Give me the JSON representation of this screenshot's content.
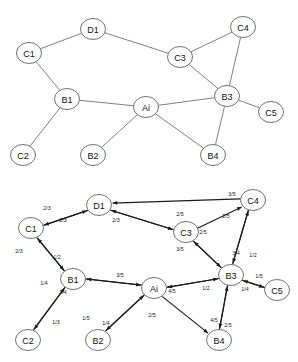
{
  "figure": {
    "title": "",
    "width": 298,
    "height": 362,
    "background_color": "#ffffff",
    "node_stroke_color": "#4d4d4d",
    "edge_color": "#555555",
    "arrow_color": "#1a1a1a",
    "label_color": "#111111"
  },
  "panels": [
    {
      "id": "upper-graph",
      "name": "undirected-topology-graph",
      "type": "graph",
      "directed": false,
      "weighted": false,
      "nodes": [
        {
          "id": "C1",
          "label": "C1",
          "x": 29,
          "y": 53
        },
        {
          "id": "D1",
          "label": "D1",
          "x": 93,
          "y": 29
        },
        {
          "id": "C3",
          "label": "C3",
          "x": 180,
          "y": 57
        },
        {
          "id": "C4",
          "label": "C4",
          "x": 243,
          "y": 27
        },
        {
          "id": "B3",
          "label": "B3",
          "x": 227,
          "y": 96
        },
        {
          "id": "C5",
          "label": "C5",
          "x": 271,
          "y": 112
        },
        {
          "id": "B1",
          "label": "B1",
          "x": 67,
          "y": 99
        },
        {
          "id": "Ai",
          "label": "Ai",
          "x": 146,
          "y": 107
        },
        {
          "id": "C2",
          "label": "C2",
          "x": 23,
          "y": 155
        },
        {
          "id": "B2",
          "label": "B2",
          "x": 93,
          "y": 155
        },
        {
          "id": "B4",
          "label": "B4",
          "x": 213,
          "y": 155
        }
      ],
      "edges": [
        {
          "from": "C1",
          "to": "D1"
        },
        {
          "from": "D1",
          "to": "C3"
        },
        {
          "from": "C3",
          "to": "C4"
        },
        {
          "from": "C3",
          "to": "B3"
        },
        {
          "from": "C4",
          "to": "B3"
        },
        {
          "from": "B3",
          "to": "C5"
        },
        {
          "from": "B3",
          "to": "Ai"
        },
        {
          "from": "B3",
          "to": "B4"
        },
        {
          "from": "C1",
          "to": "B1"
        },
        {
          "from": "B1",
          "to": "Ai"
        },
        {
          "from": "B1",
          "to": "C2"
        },
        {
          "from": "Ai",
          "to": "B2"
        },
        {
          "from": "Ai",
          "to": "B4"
        }
      ]
    },
    {
      "id": "lower-graph",
      "name": "directed-weighted-graph",
      "type": "graph",
      "directed": true,
      "weighted": true,
      "nodes": [
        {
          "id": "C1",
          "label": "C1",
          "x": 31,
          "y": 228
        },
        {
          "id": "D1",
          "label": "D1",
          "x": 99,
          "y": 205
        },
        {
          "id": "C3",
          "label": "C3",
          "x": 186,
          "y": 232
        },
        {
          "id": "C4",
          "label": "C4",
          "x": 253,
          "y": 200
        },
        {
          "id": "B3",
          "label": "B3",
          "x": 231,
          "y": 275
        },
        {
          "id": "C5",
          "label": "C5",
          "x": 277,
          "y": 290
        },
        {
          "id": "B1",
          "label": "B1",
          "x": 73,
          "y": 279
        },
        {
          "id": "Ai",
          "label": "Ai",
          "x": 154,
          "y": 288
        },
        {
          "id": "C2",
          "label": "C2",
          "x": 28,
          "y": 340
        },
        {
          "id": "B2",
          "label": "B2",
          "x": 98,
          "y": 340
        },
        {
          "id": "B4",
          "label": "B4",
          "x": 219,
          "y": 340
        }
      ],
      "arcs": [
        {
          "from": "C1",
          "to": "D1",
          "weight": "2/3",
          "label_x": 47,
          "label_y": 208
        },
        {
          "from": "D1",
          "to": "C1",
          "weight": "2/3",
          "label_x": 63,
          "label_y": 220
        },
        {
          "from": "D1",
          "to": "C3",
          "weight": "2/3",
          "label_x": 116,
          "label_y": 220
        },
        {
          "from": "C3",
          "to": "D1",
          "weight": "2/5",
          "label_x": 180,
          "label_y": 214
        },
        {
          "from": "C4",
          "to": "D1",
          "weight": "3/5",
          "label_x": 232,
          "label_y": 194
        },
        {
          "from": "C3",
          "to": "C4",
          "weight": "2/5",
          "label_x": 226,
          "label_y": 216
        },
        {
          "from": "C4",
          "to": "B3",
          "weight": "3/4",
          "label_x": 236,
          "label_y": 253
        },
        {
          "from": "B3",
          "to": "C4",
          "weight": "1/2",
          "label_x": 253,
          "label_y": 255
        },
        {
          "from": "C3",
          "to": "B3",
          "weight": "3/5",
          "label_x": 180,
          "label_y": 249
        },
        {
          "from": "B3",
          "to": "C3",
          "weight": "2/5",
          "label_x": 203,
          "label_y": 232
        },
        {
          "from": "C1",
          "to": "B1",
          "weight": "2/3",
          "label_x": 19,
          "label_y": 251
        },
        {
          "from": "B1",
          "to": "C1",
          "weight": "1/2",
          "label_x": 57,
          "label_y": 257
        },
        {
          "from": "B1",
          "to": "C2",
          "weight": "1/4",
          "label_x": 44,
          "label_y": 283
        },
        {
          "from": "C2",
          "to": "B1",
          "weight": "1/3",
          "label_x": 56,
          "label_y": 322
        },
        {
          "from": "Ai",
          "to": "B1",
          "weight": "3/5",
          "label_x": 120,
          "label_y": 275
        },
        {
          "from": "B1",
          "to": "Ai",
          "weight": "3/4",
          "label_x": 63,
          "label_y": 292
        },
        {
          "from": "Ai",
          "to": "B2",
          "weight": "1/5",
          "label_x": 86,
          "label_y": 318
        },
        {
          "from": "B2",
          "to": "Ai",
          "weight": "1/4",
          "label_x": 106,
          "label_y": 323
        },
        {
          "from": "Ai",
          "to": "B3",
          "weight": "4/5",
          "label_x": 172,
          "label_y": 291
        },
        {
          "from": "B3",
          "to": "Ai",
          "weight": "1/2",
          "label_x": 206,
          "label_y": 288
        },
        {
          "from": "Ai",
          "to": "B4",
          "weight": "2/5",
          "label_x": 152,
          "label_y": 315
        },
        {
          "from": "B3",
          "to": "B4",
          "weight": "4/5",
          "label_x": 214,
          "label_y": 320
        },
        {
          "from": "B4",
          "to": "B3",
          "weight": "2/5",
          "label_x": 228,
          "label_y": 325
        },
        {
          "from": "B3",
          "to": "C5",
          "weight": "1/4",
          "label_x": 245,
          "label_y": 289
        },
        {
          "from": "C5",
          "to": "B3",
          "weight": "1/5",
          "label_x": 259,
          "label_y": 276
        }
      ]
    }
  ]
}
